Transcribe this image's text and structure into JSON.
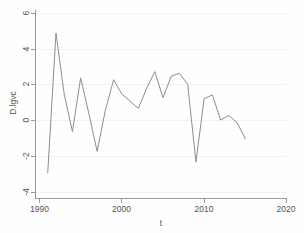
{
  "chart_data": {
    "type": "line",
    "title": "",
    "xlabel": "t",
    "ylabel": "D.lgvc",
    "xlim": [
      1990,
      2020
    ],
    "ylim": [
      -4,
      6
    ],
    "xticks": [
      1990,
      2000,
      2010,
      2020
    ],
    "yticks": [
      -4,
      -2,
      0,
      2,
      4,
      6
    ],
    "xtick_labels": [
      "1990",
      "2000",
      "2010",
      "2020"
    ],
    "ytick_labels": [
      "-4",
      "-2",
      "0",
      "2",
      "4",
      "6"
    ],
    "grid": true,
    "legend": "none",
    "line_color": "#8d8d8d",
    "series": [
      {
        "name": "D.lgvc",
        "x": [
          1991,
          1992,
          1993,
          1994,
          1995,
          1996,
          1997,
          1998,
          1999,
          2000,
          2001,
          2002,
          2003,
          2004,
          2005,
          2006,
          2007,
          2008,
          2009,
          2010,
          2011,
          2012,
          2013,
          2014,
          2015
        ],
        "values": [
          -2.9,
          4.9,
          1.5,
          -0.6,
          2.4,
          0.4,
          -1.7,
          0.6,
          2.3,
          1.5,
          1.1,
          0.7,
          1.8,
          2.75,
          1.3,
          2.5,
          2.65,
          2.05,
          -2.3,
          1.25,
          1.45,
          0.05,
          0.3,
          -0.1,
          -1.0
        ]
      }
    ]
  },
  "axis": {
    "x_title": "t",
    "y_title": "D.lgvc",
    "x_tick_0": "1990",
    "x_tick_1": "2000",
    "x_tick_2": "2010",
    "x_tick_3": "2020",
    "y_tick_0": "6",
    "y_tick_1": "4",
    "y_tick_2": "2",
    "y_tick_3": "0",
    "y_tick_4": "-2",
    "y_tick_5": "-4"
  }
}
